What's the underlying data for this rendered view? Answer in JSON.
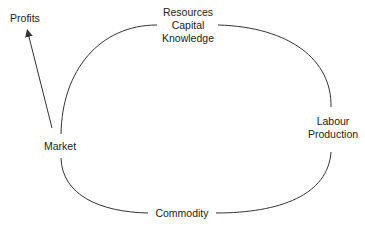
{
  "diagram": {
    "colors": {
      "line": "#333333",
      "text": "#222222",
      "background": "#ffffff"
    },
    "nodes": {
      "profits": {
        "lines": [
          "Profits"
        ]
      },
      "resources": {
        "lines": [
          "Resources",
          "Capital",
          "Knowledge"
        ]
      },
      "labour": {
        "lines": [
          "Labour",
          "Production"
        ]
      },
      "market": {
        "lines": [
          "Market"
        ]
      },
      "commodity": {
        "lines": [
          "Commodity"
        ]
      }
    },
    "edges": [
      {
        "from": "market",
        "to": "resources",
        "style": "curve"
      },
      {
        "from": "resources",
        "to": "labour",
        "style": "curve"
      },
      {
        "from": "labour",
        "to": "commodity",
        "style": "curve"
      },
      {
        "from": "commodity",
        "to": "market",
        "style": "curve"
      },
      {
        "from": "market",
        "to": "profits",
        "style": "arrow"
      }
    ]
  }
}
